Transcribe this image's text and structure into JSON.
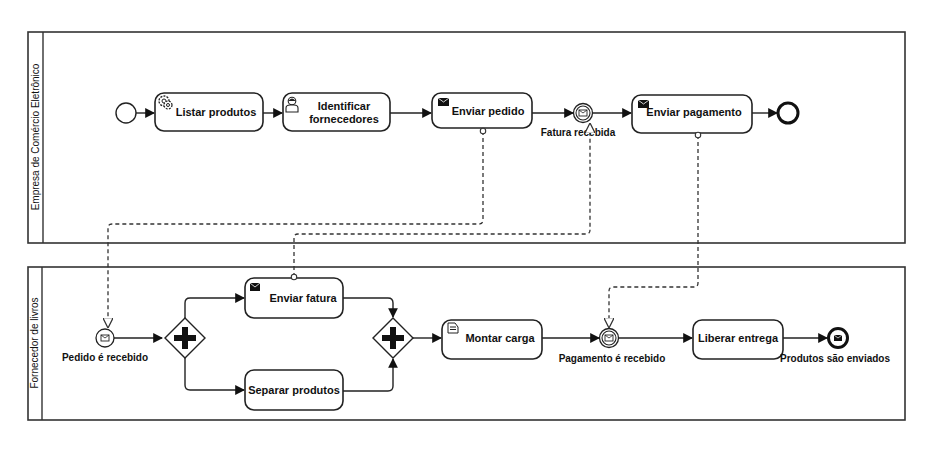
{
  "pools": [
    {
      "name": "Empresa de Comércio Eletrônico",
      "elements": {
        "start": {
          "type": "start-event"
        },
        "listar": {
          "label": "Listar produtos",
          "type": "service-task"
        },
        "identificar": {
          "label_line1": "Identificar",
          "label_line2": "fornecedores",
          "type": "user-task"
        },
        "enviar_pedido": {
          "label": "Enviar pedido",
          "type": "send-task"
        },
        "fatura_recebida": {
          "label": "Fatura recebida",
          "type": "message-intermediate-catch-event"
        },
        "enviar_pagamento": {
          "label": "Enviar pagamento",
          "type": "send-task"
        },
        "end": {
          "type": "end-event"
        }
      }
    },
    {
      "name": "Fornecedor de livros",
      "elements": {
        "pedido_recebido": {
          "label": "Pedido é recebido",
          "type": "message-start-event"
        },
        "gateway_split": {
          "type": "parallel-gateway"
        },
        "enviar_fatura": {
          "label": "Enviar fatura",
          "type": "send-task"
        },
        "separar": {
          "label": "Separar produtos",
          "type": "task"
        },
        "gateway_join": {
          "type": "parallel-gateway"
        },
        "montar": {
          "label": "Montar carga",
          "type": "business-rule-task"
        },
        "pagamento_recebido": {
          "label": "Pagamento é recebido",
          "type": "message-intermediate-catch-event"
        },
        "liberar": {
          "label": "Liberar entrega",
          "type": "task"
        },
        "produtos_enviados": {
          "label": "Produtos são enviados",
          "type": "message-end-event"
        }
      }
    }
  ],
  "message_flows": [
    {
      "from": "Enviar pedido",
      "to": "Pedido é recebido"
    },
    {
      "from": "Enviar fatura",
      "to": "Fatura recebida"
    },
    {
      "from": "Enviar pagamento",
      "to": "Pagamento é recebido"
    }
  ],
  "colors": {
    "stroke": "#222222",
    "background": "#ffffff",
    "icon_fill": "#111111"
  }
}
